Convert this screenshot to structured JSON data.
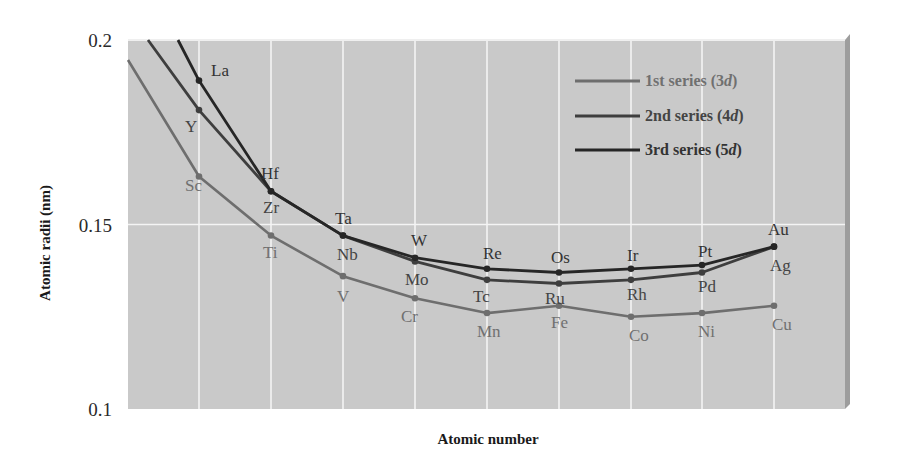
{
  "chart_data": {
    "type": "line",
    "title": "",
    "xlabel": "Atomic number",
    "ylabel": "Atomic radii (nm)",
    "ylim": [
      0.1,
      0.2
    ],
    "yticks": [
      "0.1",
      "0.15",
      "0.2"
    ],
    "grid": true,
    "legend_position": "upper-right",
    "x": [
      1,
      2,
      3,
      4,
      5,
      6,
      7,
      8,
      9
    ],
    "series": [
      {
        "name": "1st series (3d)",
        "italic_part": "d",
        "color": "#6e6e6e",
        "label_color": "#707070",
        "elements": [
          "Sc",
          "Ti",
          "V",
          "Cr",
          "Mn",
          "Fe",
          "Co",
          "Ni",
          "Cu"
        ],
        "values": [
          0.163,
          0.147,
          0.136,
          0.13,
          0.126,
          0.128,
          0.125,
          0.126,
          0.128
        ],
        "lead_in": 0.195
      },
      {
        "name": "2nd series (4d)",
        "italic_part": "d",
        "color": "#3e3e3e",
        "label_color": "#444444",
        "elements": [
          "Y",
          "Zr",
          "Nb",
          "Mo",
          "Tc",
          "Ru",
          "Rh",
          "Pd",
          "Ag"
        ],
        "values": [
          0.181,
          0.159,
          0.147,
          0.14,
          0.135,
          0.134,
          0.135,
          0.137,
          0.144
        ],
        "lead_in": 0.2
      },
      {
        "name": "3rd series (5d)",
        "italic_part": "d",
        "color": "#262626",
        "label_color": "#333333",
        "elements": [
          "La",
          "Hf",
          "Ta",
          "W",
          "Re",
          "Os",
          "Ir",
          "Pt",
          "Au"
        ],
        "values": [
          0.189,
          0.159,
          0.147,
          0.141,
          0.138,
          0.137,
          0.138,
          0.139,
          0.144
        ],
        "lead_in": 0.2
      }
    ]
  },
  "style": {
    "plot_background": "#c9c9c9",
    "grid_color": "#f4f4f4",
    "side_shadow": "#9d9d9d"
  }
}
